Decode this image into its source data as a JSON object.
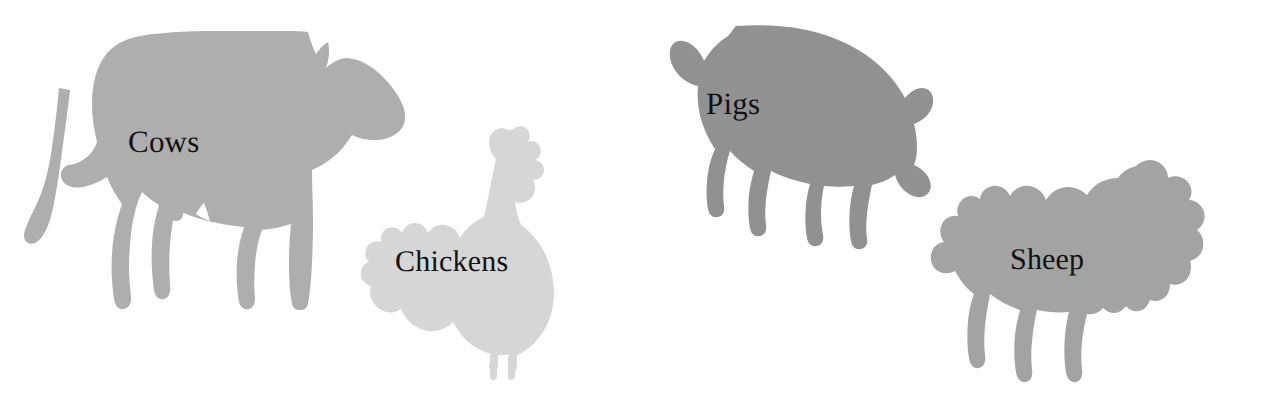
{
  "canvas": {
    "width": 1264,
    "height": 406,
    "background": "#ffffff"
  },
  "label_color": "#111111",
  "animals": [
    {
      "id": "cow",
      "label": "Cows",
      "icon": "cow-silhouette-icon",
      "fill": "#aeaeae",
      "order": 1,
      "facing": "right",
      "size_rank": "largest"
    },
    {
      "id": "chicken",
      "label": "Chickens",
      "icon": "chicken-silhouette-icon",
      "fill": "#d6d6d6",
      "order": 2,
      "facing": "right",
      "size_rank": "smallest"
    },
    {
      "id": "pig",
      "label": "Pigs",
      "icon": "pig-silhouette-icon",
      "fill": "#919191",
      "order": 3,
      "facing": "right",
      "size_rank": "large"
    },
    {
      "id": "sheep",
      "label": "Sheep",
      "icon": "sheep-silhouette-icon",
      "fill": "#a3a3a3",
      "order": 4,
      "facing": "right",
      "size_rank": "medium"
    }
  ]
}
